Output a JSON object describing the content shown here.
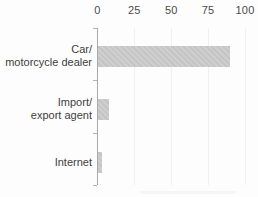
{
  "chart_data": {
    "type": "bar",
    "orientation": "horizontal",
    "title": "",
    "xlabel": "",
    "ylabel": "",
    "categories": [
      "Car/motorcycle dealer",
      "Import/export agent",
      "Internet"
    ],
    "label_lines": [
      [
        "Car/",
        "motorcycle dealer"
      ],
      [
        "Import/",
        "export agent"
      ],
      [
        "Internet"
      ]
    ],
    "values": [
      90,
      8,
      3
    ],
    "x_ticks": [
      0,
      25,
      50,
      75,
      100
    ],
    "xlim": [
      0,
      100
    ],
    "legend": "none",
    "grid": "faint vertical gridlines at x ticks",
    "axis_position": "x-axis labels on top, y-axis line on left",
    "colors": {
      "bar_fill": "#c9c9c9",
      "axis_line": "#a8a8a8",
      "tick_text": "#4a4a4a",
      "category_text": "#3d3d3d",
      "gridline": "#f0f0f0",
      "background": "#fdfdfd"
    }
  }
}
